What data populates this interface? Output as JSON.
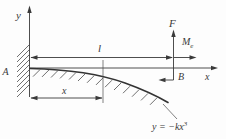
{
  "diagram": {
    "labels": {
      "y_axis": "y",
      "x_axis": "x",
      "support": "A",
      "beam_end": "B",
      "force": "F",
      "moment_main": "M",
      "moment_sub": "e",
      "beam_length": "l",
      "distance": "x",
      "equation_main": "y = −kx",
      "equation_sup": "3"
    },
    "colors": {
      "ink": "#3a3a3a",
      "background": "#fdfdfd"
    }
  }
}
